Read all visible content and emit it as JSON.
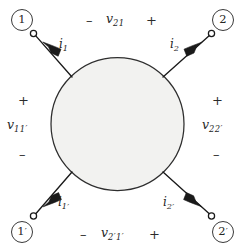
{
  "figure": {
    "network_shape": "shaded-circle-blob",
    "colors": {
      "blob_fill": "#f2f2f0",
      "blob_stroke": "#2e2e2e",
      "lead_stroke": "#1a1a1a",
      "text": "#262626",
      "terminal_fill": "#ffffff"
    }
  },
  "ports": [
    {
      "id": "port-1-top-left",
      "node_label": "1",
      "node_prime": "",
      "current_symbol": "i",
      "current_subscript": "1",
      "terminal": "open-circle",
      "arrow_direction": "into-network-down-right"
    },
    {
      "id": "port-2-top-right",
      "node_label": "2",
      "node_prime": "",
      "current_symbol": "i",
      "current_subscript": "2",
      "terminal": "open-circle",
      "arrow_direction": "into-network-down-left"
    },
    {
      "id": "port-1prime-bottom-left",
      "node_label": "1",
      "node_prime": "′",
      "current_symbol": "i",
      "current_subscript": "1′",
      "terminal": "open-circle",
      "arrow_direction": "into-network-up-right"
    },
    {
      "id": "port-2prime-bottom-right",
      "node_label": "2",
      "node_prime": "′",
      "current_symbol": "i",
      "current_subscript": "2′",
      "terminal": "open-circle",
      "arrow_direction": "into-network-up-left"
    }
  ],
  "voltages": {
    "top": {
      "symbol": "v",
      "subscript": "21",
      "minus_sign": "–",
      "plus_sign": "+",
      "minus_side": "left",
      "plus_side": "right"
    },
    "left": {
      "symbol": "v",
      "subscript": "11′",
      "minus_sign": "–",
      "plus_sign": "+",
      "plus_side": "top",
      "minus_side": "bottom"
    },
    "right": {
      "symbol": "v",
      "subscript": "22′",
      "minus_sign": "–",
      "plus_sign": "+",
      "plus_side": "top",
      "minus_side": "bottom"
    },
    "bottom": {
      "symbol": "v",
      "subscript": "2′1′",
      "minus_sign": "–",
      "plus_sign": "+",
      "minus_side": "left",
      "plus_side": "right"
    }
  }
}
